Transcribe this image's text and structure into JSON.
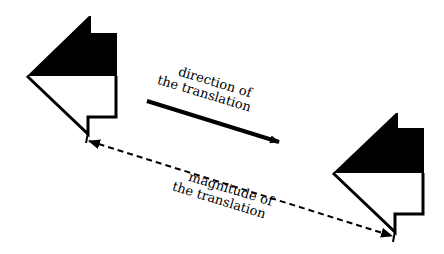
{
  "diagram": {
    "type": "translation-illustration",
    "colors": {
      "ink": "#000000",
      "background": "#ffffff"
    },
    "shapes": [
      {
        "name": "original-figure",
        "description": "house-like flag shape, top half filled black"
      },
      {
        "name": "translated-figure",
        "description": "same shape shifted down-right"
      }
    ],
    "direction_label": {
      "line1": "direction of",
      "line2": "the translation"
    },
    "magnitude_label": {
      "line1": "magnitude of",
      "line2": "the translation"
    }
  }
}
